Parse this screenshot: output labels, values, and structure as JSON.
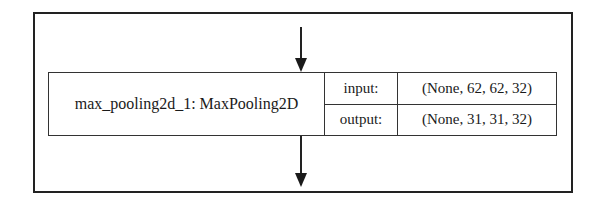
{
  "diagram": {
    "type": "keras-model-plot-node",
    "node": {
      "name": "max_pooling2d_1: MaxPooling2D",
      "ports": [
        {
          "label": "input:",
          "shape": "(None, 62, 62, 32)"
        },
        {
          "label": "output:",
          "shape": "(None, 31, 31, 32)"
        }
      ]
    },
    "edges": [
      {
        "name": "incoming-arrow",
        "direction": "down"
      },
      {
        "name": "outgoing-arrow",
        "direction": "down"
      }
    ],
    "colors": {
      "line": "#222222",
      "background": "#ffffff",
      "text": "#1a1a1a"
    }
  }
}
